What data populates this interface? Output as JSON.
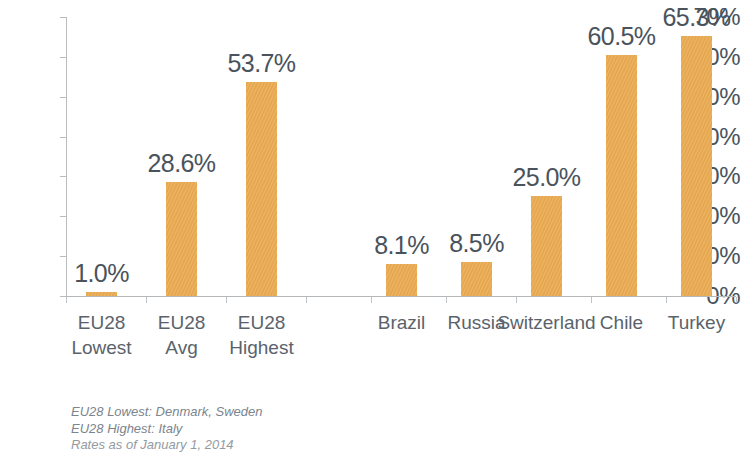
{
  "chart_data": {
    "type": "bar",
    "title": "",
    "subtitle": "",
    "xlabel": "",
    "ylabel": "",
    "ylim": [
      0,
      70
    ],
    "y_ticks": [
      "0%",
      "10%",
      "20%",
      "30%",
      "40%",
      "50%",
      "60%",
      "70%"
    ],
    "y_tick_values": [
      0,
      10,
      20,
      30,
      40,
      50,
      60,
      70
    ],
    "grid": false,
    "legend": "none",
    "bar_color": "#eaab52",
    "text_color": "#4a535c",
    "axis_color": "#b9bdc0",
    "categories": [
      "EU28 Lowest",
      "EU28 Avg",
      "EU28 Highest",
      "Brazil",
      "Russia",
      "Switzerland",
      "Chile",
      "Turkey"
    ],
    "category_lines": [
      [
        "EU28",
        "Lowest"
      ],
      [
        "EU28",
        "Avg"
      ],
      [
        "EU28",
        "Highest"
      ],
      [
        "Brazil",
        ""
      ],
      [
        "Russia",
        ""
      ],
      [
        "Switzerland",
        ""
      ],
      [
        "Chile",
        ""
      ],
      [
        "Turkey",
        ""
      ]
    ],
    "values": [
      1.0,
      28.6,
      53.7,
      8.1,
      8.5,
      25.0,
      60.5,
      65.3
    ],
    "data_labels": [
      "1.0%",
      "28.6%",
      "53.7%",
      "8.1%",
      "8.5%",
      "25.0%",
      "60.5%",
      "65.3%"
    ]
  },
  "footnotes": [
    "EU28 Lowest: Denmark, Sweden",
    "EU28 Highest: Italy",
    "Rates as of January 1, 2014"
  ]
}
